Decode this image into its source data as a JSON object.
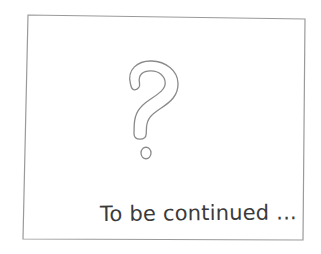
{
  "slide": {
    "background_color": "#ffffff",
    "frame": {
      "stroke_color": "#9a9a9a",
      "stroke_width": 1.2,
      "corners": {
        "top_left": [
          28,
          15
        ],
        "top_right": [
          305,
          19
        ],
        "bottom_right": [
          303,
          240
        ],
        "bottom_left": [
          23,
          239
        ]
      }
    },
    "question_mark": {
      "icon": "question-mark-outline-icon",
      "character": "?",
      "style": "outline",
      "stroke_color": "#8a8a8a",
      "bounds": [
        124,
        61,
        55,
        78
      ]
    },
    "question_dot": {
      "icon": "question-mark-dot-icon",
      "shape": "hollow-circle",
      "stroke_color": "#8a8a8a",
      "center": [
        146,
        153
      ],
      "radius": 5
    },
    "caption": {
      "text": "To be continued ...",
      "color": "#3a3a3a",
      "font_size_px": 21
    }
  }
}
